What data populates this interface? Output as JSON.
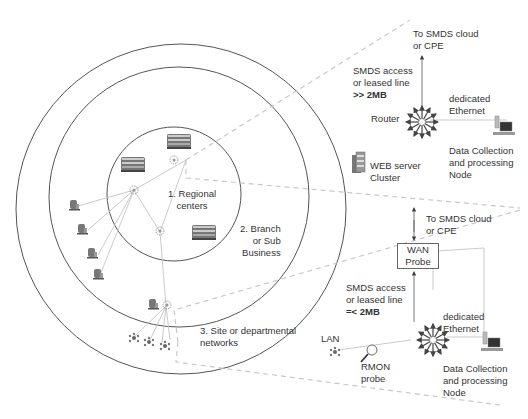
{
  "diagram": {
    "zones": [
      {
        "id": "regional",
        "label_lines": [
          "1. Regional",
          "centers"
        ]
      },
      {
        "id": "branch",
        "label_lines": [
          "2. Branch",
          "or Sub",
          "Business"
        ]
      },
      {
        "id": "site",
        "label_lines": [
          "3. Site or departmental",
          "networks"
        ]
      }
    ],
    "top_detail": {
      "uplink_lines": [
        "To SMDS cloud",
        "or CPE"
      ],
      "access_lines": [
        "SMDS access",
        "or leased line"
      ],
      "access_speed": ">> 2MB",
      "router_label": "Router",
      "ethernet_lines": [
        "dedicated",
        "Ethernet"
      ],
      "node_lines": [
        "Data Collection",
        "and processing",
        "Node"
      ],
      "web_cluster_lines": [
        "WEB server",
        "Cluster"
      ]
    },
    "bottom_detail": {
      "uplink_lines": [
        "To SMDS cloud",
        "or CPE"
      ],
      "wan_probe_lines": [
        "WAN",
        "Probe"
      ],
      "access_lines": [
        "SMDS access",
        "or leased line"
      ],
      "access_speed": "=< 2MB",
      "ethernet_lines": [
        "dedicated",
        "Ethernet"
      ],
      "lan_label": "LAN",
      "rmon_lines": [
        "RMON",
        "probe"
      ],
      "node_lines": [
        "Data Collection",
        "and processing",
        "Node"
      ]
    },
    "icons": [
      "building-icon",
      "hub-icon",
      "small-building-icon",
      "workgroup-icon",
      "router-icon",
      "workstation-icon",
      "server-cluster-icon",
      "magnifier-probe-icon"
    ],
    "colors": {
      "line": "#555555",
      "link": "#bbbbbb",
      "dash": "#c8c8c8",
      "text": "#333333"
    }
  }
}
